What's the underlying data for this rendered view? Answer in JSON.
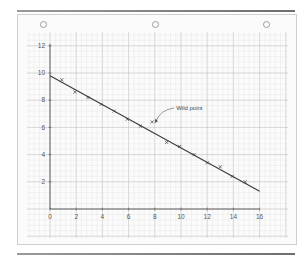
{
  "chart_data": {
    "type": "scatter",
    "title": "",
    "xlabel": "",
    "ylabel": "",
    "xlim": [
      0,
      16
    ],
    "ylim": [
      0,
      12
    ],
    "grid": true,
    "x_ticks": [
      "0",
      "2",
      "4",
      "6",
      "8",
      "10",
      "12",
      "14",
      "16"
    ],
    "y_ticks": [
      "2",
      "4",
      "6",
      "8",
      "10",
      "12"
    ],
    "series": [
      {
        "name": "Measured points",
        "marker": "x",
        "points": [
          {
            "x": 0.9,
            "y": 9.5
          },
          {
            "x": 1.9,
            "y": 8.6
          },
          {
            "x": 2.9,
            "y": 8.2
          },
          {
            "x": 3.9,
            "y": 7.7
          },
          {
            "x": 4.9,
            "y": 7.2
          },
          {
            "x": 5.9,
            "y": 6.6
          },
          {
            "x": 6.9,
            "y": 6.1
          },
          {
            "x": 8.9,
            "y": 4.9
          },
          {
            "x": 9.9,
            "y": 4.6
          },
          {
            "x": 11.0,
            "y": 4.0
          },
          {
            "x": 12.0,
            "y": 3.4
          },
          {
            "x": 13.0,
            "y": 3.1
          },
          {
            "x": 13.9,
            "y": 2.4
          },
          {
            "x": 14.9,
            "y": 2.0
          }
        ]
      },
      {
        "name": "Wild point",
        "marker": "x",
        "points": [
          {
            "x": 7.8,
            "y": 6.4
          }
        ]
      }
    ],
    "fit_line": {
      "x0": 0,
      "y0": 9.8,
      "x1": 16,
      "y1": 1.3
    },
    "annotations": [
      {
        "text": "Wild point",
        "target": {
          "x": 7.8,
          "y": 6.4
        }
      }
    ]
  },
  "colors": {
    "paper": "#fbfbfb",
    "grid_major": "#bdbdbd",
    "grid_minor": "#e2e2e2",
    "ink": "#444444"
  }
}
